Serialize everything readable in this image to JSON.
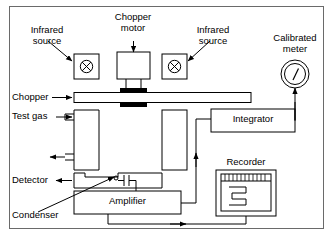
{
  "figure": {
    "background_color": "#ffffff",
    "frame_color": "#6a6a6a",
    "line_color": "#000000"
  },
  "labels": {
    "infrared_source_left": "Infrared\nsource",
    "infrared_source_left_line1": "Infrared",
    "infrared_source_left_line2": "source",
    "chopper_motor_line1": "Chopper",
    "chopper_motor_line2": "motor",
    "infrared_source_right_line1": "Infrared",
    "infrared_source_right_line2": "source",
    "calibrated_meter_line1": "Calibrated",
    "calibrated_meter_line2": "meter",
    "chopper": "Chopper",
    "test_gas": "Test gas",
    "detector": "Detector",
    "condenser": "Condenser",
    "amplifier": "Amplifier",
    "integrator": "Integrator",
    "recorder": "Recorder"
  },
  "components": [
    {
      "name": "infrared-source-left",
      "label": "Infrared source",
      "symbol": "circled-x"
    },
    {
      "name": "infrared-source-right",
      "label": "Infrared source",
      "symbol": "circled-x"
    },
    {
      "name": "chopper-motor",
      "label": "Chopper motor",
      "symbol": "box"
    },
    {
      "name": "chopper-bar",
      "label": "Chopper",
      "symbol": "bar"
    },
    {
      "name": "test-gas-cell",
      "label": "Test gas",
      "symbol": "chamber"
    },
    {
      "name": "reference-cell",
      "label": "",
      "symbol": "chamber"
    },
    {
      "name": "detector-bar",
      "label": "Detector",
      "symbol": "bar"
    },
    {
      "name": "condenser",
      "label": "Condenser",
      "symbol": "capacitor"
    },
    {
      "name": "amplifier",
      "label": "Amplifier",
      "symbol": "box"
    },
    {
      "name": "integrator",
      "label": "Integrator",
      "symbol": "box"
    },
    {
      "name": "recorder",
      "label": "Recorder",
      "symbol": "chart-box"
    },
    {
      "name": "calibrated-meter",
      "label": "Calibrated meter",
      "symbol": "gauge"
    }
  ]
}
